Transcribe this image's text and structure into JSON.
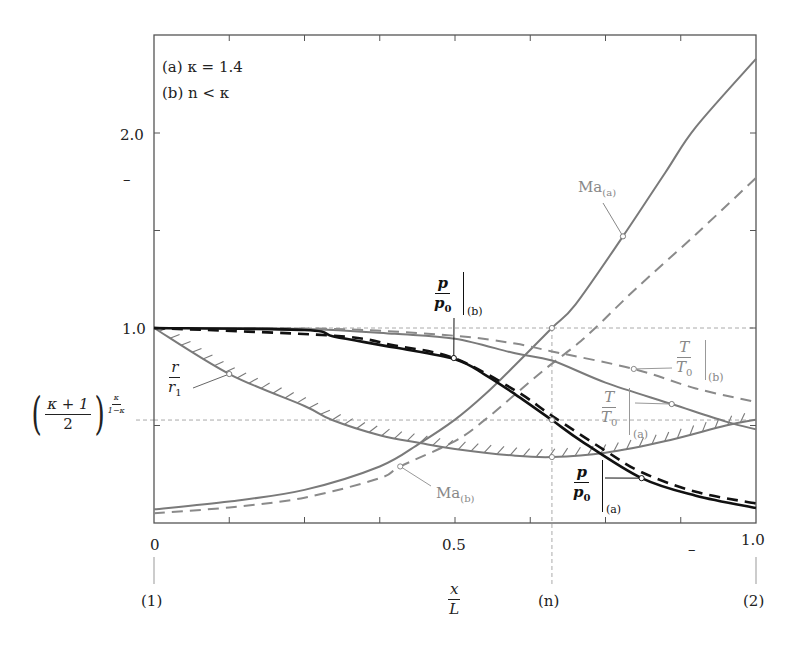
{
  "chart_data": {
    "type": "line",
    "title": "",
    "annotations": {
      "case_a": "(a) κ = 1.4",
      "case_b": "(b) n < κ"
    },
    "xlabel": {
      "num": "x",
      "den": "L"
    },
    "ylabel": "",
    "xlim": [
      0,
      1.0
    ],
    "ylim": [
      0,
      2.5
    ],
    "grid": false,
    "x_ticks": [
      0,
      0.125,
      0.25,
      0.375,
      0.5,
      0.625,
      0.75,
      0.875,
      1.0
    ],
    "x_tick_labels": [
      {
        "value": 0,
        "label": "0"
      },
      {
        "value": 0.5,
        "label": "0.5"
      },
      {
        "value": 1.0,
        "label": "1.0"
      }
    ],
    "y_ticks": [
      0.5,
      1.0,
      1.5,
      2.0
    ],
    "y_tick_labels": [
      {
        "value": 1.0,
        "label": "1.0"
      },
      {
        "value": 2.0,
        "label": "2.0"
      }
    ],
    "stray_marks": {
      "y_axis_dash": "–",
      "x_axis_dash": "–"
    },
    "stations": [
      {
        "x": 0,
        "label": "(1)"
      },
      {
        "x": 0.661,
        "label": "(n)"
      },
      {
        "x": 1.0,
        "label": "(2)"
      }
    ],
    "reference_lines": {
      "horizontal": [
        {
          "y": 1.0,
          "label": "1.0"
        },
        {
          "y": 0.528,
          "label_base": "κ + 1",
          "label_den": "2",
          "label_exp": "κ/(1−κ)"
        }
      ],
      "vertical": [
        {
          "x": 0.661,
          "label": "(n)"
        }
      ]
    },
    "series": [
      {
        "name": "Ma(a)",
        "label_main": "Ma",
        "label_sub": "(a)",
        "style": "solid",
        "color": "#7a7a7a",
        "width": 2,
        "x": [
          0,
          0.125,
          0.25,
          0.375,
          0.442,
          0.5,
          0.55,
          0.6,
          0.661,
          0.7,
          0.779,
          0.85,
          0.9,
          1.0
        ],
        "y": [
          0.07,
          0.11,
          0.17,
          0.29,
          0.41,
          0.53,
          0.66,
          0.81,
          1.0,
          1.12,
          1.47,
          1.8,
          2.03,
          2.38
        ],
        "marker": {
          "x": 0.779,
          "y": 1.47
        }
      },
      {
        "name": "Ma(b)",
        "label_main": "Ma",
        "label_sub": "(b)",
        "style": "dashed",
        "color": "#8a8a8a",
        "width": 2,
        "x": [
          0,
          0.125,
          0.25,
          0.375,
          0.409,
          0.5,
          0.55,
          0.6,
          0.65,
          0.7,
          0.733,
          0.8,
          0.9,
          1.0
        ],
        "y": [
          0.05,
          0.08,
          0.13,
          0.23,
          0.29,
          0.42,
          0.53,
          0.66,
          0.79,
          0.91,
          1.0,
          1.2,
          1.48,
          1.77
        ],
        "marker": {
          "x": 0.409,
          "y": 0.29
        }
      },
      {
        "name": "r/r1",
        "label_num": "r",
        "label_den": "r",
        "label_den_sub": "1",
        "style": "solid-hatched",
        "color": "#7a7a7a",
        "width": 2,
        "x": [
          0,
          0.125,
          0.25,
          0.296,
          0.375,
          0.442,
          0.5,
          0.6,
          0.661,
          0.75,
          0.85,
          0.95,
          1.0
        ],
        "y": [
          1.0,
          0.764,
          0.6,
          0.528,
          0.45,
          0.41,
          0.38,
          0.345,
          0.338,
          0.36,
          0.42,
          0.5,
          0.53
        ],
        "marker": {
          "x": 0.125,
          "y": 0.764
        }
      },
      {
        "name": "T/T0(a)",
        "label_num": "T",
        "label_den": "T",
        "label_den_sub": "0",
        "label_case": "(a)",
        "style": "solid",
        "color": "#7a7a7a",
        "width": 2,
        "x": [
          0,
          0.25,
          0.4,
          0.5,
          0.6,
          0.661,
          0.75,
          0.86,
          0.95,
          1.0
        ],
        "y": [
          1.0,
          0.995,
          0.97,
          0.945,
          0.87,
          0.833,
          0.72,
          0.61,
          0.52,
          0.48
        ],
        "marker": {
          "x": 0.86,
          "y": 0.61
        }
      },
      {
        "name": "T/T0(b)",
        "label_num": "T",
        "label_den": "T",
        "label_den_sub": "0",
        "label_case": "(b)",
        "style": "dashed",
        "color": "#8a8a8a",
        "width": 2,
        "x": [
          0,
          0.3,
          0.5,
          0.6,
          0.661,
          0.797,
          0.9,
          1.0
        ],
        "y": [
          1.0,
          0.995,
          0.96,
          0.92,
          0.88,
          0.79,
          0.69,
          0.62
        ],
        "marker": {
          "x": 0.797,
          "y": 0.79
        }
      },
      {
        "name": "p/p0(a)",
        "label_num": "p",
        "label_den": "p",
        "label_den_sub": "0",
        "label_case": "(a)",
        "style": "solid",
        "color": "#111111",
        "width": 2.6,
        "x": [
          0,
          0.25,
          0.3,
          0.4,
          0.5,
          0.55,
          0.6,
          0.661,
          0.71,
          0.81,
          0.9,
          1.0
        ],
        "y": [
          1.0,
          0.99,
          0.955,
          0.9,
          0.84,
          0.76,
          0.66,
          0.528,
          0.42,
          0.23,
          0.14,
          0.077
        ],
        "marker": {
          "x": 0.81,
          "y": 0.23
        }
      },
      {
        "name": "p/p0(b)",
        "label_num": "p",
        "label_den": "p",
        "label_den_sub": "0",
        "label_case": "(b)",
        "style": "dashed",
        "color": "#111111",
        "width": 2.6,
        "x": [
          0,
          0.3,
          0.4,
          0.498,
          0.6,
          0.661,
          0.75,
          0.81,
          0.9,
          1.0
        ],
        "y": [
          1.0,
          0.96,
          0.91,
          0.846,
          0.68,
          0.55,
          0.37,
          0.26,
          0.16,
          0.1
        ],
        "marker": {
          "x": 0.498,
          "y": 0.846
        }
      }
    ],
    "extra_markers": [
      {
        "x": 0.661,
        "y": 1.0
      },
      {
        "x": 0.661,
        "y": 0.528
      },
      {
        "x": 0.661,
        "y": 0.338
      }
    ]
  },
  "labels": {
    "ma_a": {
      "main": "Ma",
      "sub": "(a)"
    },
    "ma_b": {
      "main": "Ma",
      "sub": "(b)"
    },
    "r_r1": {
      "num": "r",
      "den": "r",
      "den_sub": "1"
    },
    "t_a": {
      "num": "T",
      "den": "T",
      "den_sub": "0",
      "case": "(a)"
    },
    "t_b": {
      "num": "T",
      "den": "T",
      "den_sub": "0",
      "case": "(b)"
    },
    "p_a": {
      "num": "p",
      "den": "p",
      "den_sub": "0",
      "case": "(a)"
    },
    "p_b": {
      "num": "p",
      "den": "p",
      "den_sub": "0",
      "case": "(b)"
    },
    "crit": {
      "num": "κ + 1",
      "den": "2",
      "exp_num": "κ",
      "exp_den": "1−κ",
      "lparen": "(",
      "rparen": ")"
    },
    "xlabel": {
      "num": "x",
      "den": "L"
    }
  }
}
